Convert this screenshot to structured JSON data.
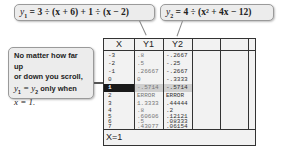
{
  "callouts": {
    "y1_equation": {
      "var": "y",
      "sub": "1",
      "rhs": " = 3 ÷ (x + 6) + 1 ÷ (x − 2)"
    },
    "y2_equation": {
      "var": "y",
      "sub": "2",
      "rhs": " = 4 ÷ (x² + 4x − 12)"
    },
    "note": {
      "line1": "No matter how far up",
      "line2": "or down you scroll,",
      "line3_a": "y",
      "line3_a_sub": "1",
      "line3_eq": " = ",
      "line3_b": "y",
      "line3_b_sub": "2",
      "line3_rest": " only when",
      "line4_var": "x",
      "line4_rest": " = 1."
    }
  },
  "table": {
    "headers": [
      "X",
      "Y1",
      "Y2",
      "",
      "",
      ""
    ],
    "rows": [
      {
        "x": "-3",
        "y1": ".8",
        "y2": "-.2667"
      },
      {
        "x": "-2",
        "y1": ".5",
        "y2": "-.25"
      },
      {
        "x": "-1",
        "y1": ".26667",
        "y2": "-.2667"
      },
      {
        "x": "0",
        "y1": "0",
        "y2": "-.3333"
      },
      {
        "x": "1",
        "y1": "-.5714",
        "y2": "-.5714",
        "selected": true
      },
      {
        "x": "2",
        "y1": "ERROR",
        "y2": "ERROR"
      },
      {
        "x": "3",
        "y1": "1.3333",
        "y2": ".44444"
      },
      {
        "x": "4",
        "y1": ".8",
        "y2": ".2"
      },
      {
        "x": "5",
        "y1": ".60606",
        "y2": ".12121"
      },
      {
        "x": "6",
        "y1": ".5",
        "y2": ".08333"
      },
      {
        "x": "7",
        "y1": ".43077",
        "y2": ".06154"
      }
    ],
    "status": "X=1"
  },
  "colors": {
    "callout_bg": "#ececec",
    "screen_bg": "#f2f2f2",
    "selected_row": "#1a1a1a",
    "grid": "#333333"
  }
}
